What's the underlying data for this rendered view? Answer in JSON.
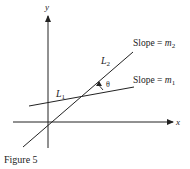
{
  "figure": {
    "caption": "Figure 5",
    "axes": {
      "x_label": "x",
      "y_label": "y"
    },
    "lines": [
      {
        "name": "L1",
        "label_main": "L",
        "label_sub": "1",
        "slope_text": "Slope = ",
        "slope_var": "m",
        "slope_sub": "1"
      },
      {
        "name": "L2",
        "label_main": "L",
        "label_sub": "2",
        "slope_text": "Slope = ",
        "slope_var": "m",
        "slope_sub": "2"
      }
    ],
    "angle_label": "θ",
    "colors": {
      "stroke": "#222222",
      "background": "#ffffff"
    }
  }
}
